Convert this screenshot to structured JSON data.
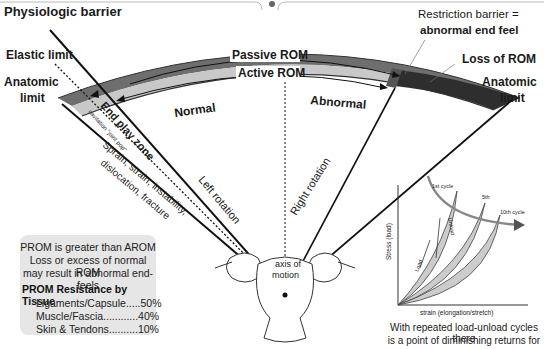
{
  "diagram": {
    "labels": {
      "physiologic_barrier": "Physiologic barrier",
      "elastic_limit": "Elastic limit",
      "anatomic_limit_left_1": "Anatomic",
      "anatomic_limit_left_2": "limit",
      "passive_rom": "Passive ROM",
      "active_rom": "Active ROM",
      "normal": "Normal",
      "abnormal": "Abnormal",
      "restriction_barrier_1": "Restriction barrier =",
      "restriction_barrier_2": "abnormal end feel",
      "loss_of_rom": "Loss of ROM",
      "anatomic_limit_right_1": "Anatomic",
      "anatomic_limit_right_2": "limit",
      "end_play_zone": "End play zone",
      "cavitation": "cavitation \"joint pop\"",
      "injury_1": "Sprain, strain, instability,",
      "injury_2": "dislocation, fracture",
      "left_rotation": "Left rotation",
      "right_rotation": "Right rotation",
      "axis_1": "axis of",
      "axis_2": "motion"
    },
    "colors": {
      "passive_band": "#6e6e6e",
      "active_band": "#c8c8c8",
      "loss_band": "#2e2e2e",
      "line": "#111111"
    }
  },
  "info_box": {
    "lines": [
      "PROM is greater than AROM",
      "Loss or excess of normal ROM",
      "may result in abnormal end-feels"
    ],
    "heading": "PROM Resistance by Tissue",
    "rows": [
      {
        "tissue": "Ligaments/Capsule",
        "value": "50%",
        "text": "Ligaments/Capsule.....50%"
      },
      {
        "tissue": "Muscle/Fascia",
        "value": "40%",
        "text": "Muscle/Fascia............40%"
      },
      {
        "tissue": "Skin & Tendons",
        "value": "10%",
        "text": "Skin & Tendons..........10%"
      }
    ]
  },
  "hysteresis_chart": {
    "ylabel": "Stress (load)",
    "xlabel": "strain (elongation/stretch)",
    "curves": [
      "1st cycle",
      "5th",
      "10th cycle"
    ],
    "arrow_labels": [
      "Load",
      "Unload"
    ],
    "caption_1": "With repeated load-unload cycles there",
    "caption_2": "is a point of diminishing returns for"
  }
}
